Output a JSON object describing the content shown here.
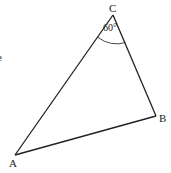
{
  "diagram": {
    "type": "triangle",
    "stroke_color": "#222222",
    "background": "#ffffff",
    "vertices": [
      {
        "name": "A",
        "label": "A",
        "x": 15,
        "y": 155,
        "label_x": 9,
        "label_y": 167
      },
      {
        "name": "B",
        "label": "B",
        "x": 156,
        "y": 116,
        "label_x": 159,
        "label_y": 122
      },
      {
        "name": "C",
        "label": "C",
        "x": 113,
        "y": 15,
        "label_x": 109,
        "label_y": 12
      }
    ],
    "angle_marker": {
      "vertex": "C",
      "label": "60°",
      "label_x": 103,
      "label_y": 31
    },
    "edge_fragment": {
      "label": "e",
      "x": -3,
      "y": 61
    }
  }
}
